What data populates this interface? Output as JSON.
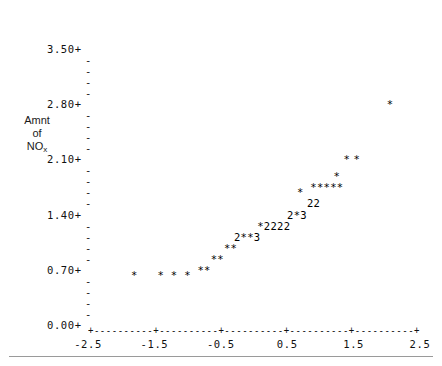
{
  "chart_data": {
    "type": "scatter",
    "title": "",
    "subtitle": "",
    "xlabel": "",
    "ylabel": "Amnt of NOx",
    "ylabel_lines": [
      "Amnt",
      "of",
      "NO",
      "x"
    ],
    "xlim": [
      -2.5,
      2.5
    ],
    "ylim": [
      0.0,
      3.5
    ],
    "xticks": [
      -2.5,
      -1.5,
      -0.5,
      0.5,
      1.5,
      2.5
    ],
    "xtick_labels": [
      "-2.5",
      "-1.5",
      "-0.5",
      "0.5",
      "1.5",
      "2.5"
    ],
    "yticks": [
      0.0,
      0.7,
      1.4,
      2.1,
      2.8,
      3.5
    ],
    "ytick_labels": [
      "0.00+",
      "0.70+",
      "1.40+",
      "2.10+",
      "2.80+",
      "3.50+"
    ],
    "ytick_minor_glyph": "-",
    "ytick_major_glyph": "+",
    "xtick_major_glyph": "+",
    "xtick_fill_glyph": "-",
    "grid": false,
    "legend": null,
    "plot_style": "character-cell-monospace",
    "point_glyphs": {
      "1": "*",
      "2": "2",
      "3": "3"
    },
    "cells": [
      {
        "x": -1.8,
        "y": 0.63,
        "glyph": "*",
        "count": 1
      },
      {
        "x": -1.4,
        "y": 0.63,
        "glyph": "*",
        "count": 1
      },
      {
        "x": -1.2,
        "y": 0.63,
        "glyph": "*",
        "count": 1
      },
      {
        "x": -1.0,
        "y": 0.63,
        "glyph": "*",
        "count": 1
      },
      {
        "x": -0.8,
        "y": 0.7,
        "glyph": "*",
        "count": 1
      },
      {
        "x": -0.7,
        "y": 0.7,
        "glyph": "*",
        "count": 1
      },
      {
        "x": -0.6,
        "y": 0.84,
        "glyph": "*",
        "count": 1
      },
      {
        "x": -0.5,
        "y": 0.84,
        "glyph": "*",
        "count": 1
      },
      {
        "x": -0.4,
        "y": 0.98,
        "glyph": "*",
        "count": 1
      },
      {
        "x": -0.3,
        "y": 0.98,
        "glyph": "*",
        "count": 1
      },
      {
        "x": -0.25,
        "y": 1.12,
        "glyph": "2",
        "count": 2
      },
      {
        "x": -0.15,
        "y": 1.12,
        "glyph": "*",
        "count": 1
      },
      {
        "x": -0.05,
        "y": 1.12,
        "glyph": "*",
        "count": 1
      },
      {
        "x": 0.05,
        "y": 1.12,
        "glyph": "3",
        "count": 3
      },
      {
        "x": 0.1,
        "y": 1.26,
        "glyph": "*",
        "count": 1
      },
      {
        "x": 0.2,
        "y": 1.26,
        "glyph": "2",
        "count": 2
      },
      {
        "x": 0.3,
        "y": 1.26,
        "glyph": "2",
        "count": 2
      },
      {
        "x": 0.4,
        "y": 1.26,
        "glyph": "2",
        "count": 2
      },
      {
        "x": 0.5,
        "y": 1.26,
        "glyph": "2",
        "count": 2
      },
      {
        "x": 0.55,
        "y": 1.4,
        "glyph": "2",
        "count": 2
      },
      {
        "x": 0.65,
        "y": 1.4,
        "glyph": "*",
        "count": 1
      },
      {
        "x": 0.75,
        "y": 1.4,
        "glyph": "3",
        "count": 3
      },
      {
        "x": 0.85,
        "y": 1.54,
        "glyph": "2",
        "count": 2
      },
      {
        "x": 0.95,
        "y": 1.54,
        "glyph": "2",
        "count": 2
      },
      {
        "x": 0.7,
        "y": 1.68,
        "glyph": "*",
        "count": 1
      },
      {
        "x": 0.9,
        "y": 1.75,
        "glyph": "*",
        "count": 1
      },
      {
        "x": 1.0,
        "y": 1.75,
        "glyph": "*",
        "count": 1
      },
      {
        "x": 1.1,
        "y": 1.75,
        "glyph": "*",
        "count": 1
      },
      {
        "x": 1.2,
        "y": 1.75,
        "glyph": "*",
        "count": 1
      },
      {
        "x": 1.3,
        "y": 1.75,
        "glyph": "*",
        "count": 1
      },
      {
        "x": 1.25,
        "y": 1.89,
        "glyph": "*",
        "count": 1
      },
      {
        "x": 1.4,
        "y": 2.1,
        "glyph": "*",
        "count": 1
      },
      {
        "x": 1.55,
        "y": 2.1,
        "glyph": "*",
        "count": 1
      },
      {
        "x": 2.05,
        "y": 2.8,
        "glyph": "*",
        "count": 1
      }
    ]
  },
  "layout": {
    "plot_left_px": 88,
    "plot_right_px": 420,
    "axis_y_px": 325,
    "y_top_px": 22,
    "row_height_px": 11.05,
    "x_per_px": 0.01506
  }
}
